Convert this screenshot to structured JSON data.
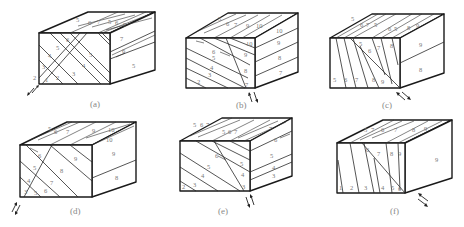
{
  "figure": {
    "panels": [
      {
        "id": "a",
        "caption": "(a)",
        "front_labels": [
          "1",
          "2",
          "3",
          "4",
          "5",
          "3",
          "4",
          "5",
          "6",
          "3",
          "2"
        ],
        "top_labels": [
          "5",
          "6",
          "7",
          "5",
          "6",
          "7"
        ],
        "right_labels": [
          "7",
          "6",
          "5"
        ],
        "shear_sense": "sinistral (arrows lower-left)"
      },
      {
        "id": "b",
        "caption": "(b)",
        "front_labels": [
          "2",
          "3",
          "4",
          "5",
          "6",
          "7",
          "8",
          "9",
          "10"
        ],
        "top_labels": [
          "5",
          "6",
          "7",
          "9",
          "10"
        ],
        "right_labels": [
          "10",
          "9",
          "8",
          "7"
        ],
        "shear_sense": "arrows below front-right corner"
      },
      {
        "id": "c",
        "caption": "(c)",
        "front_labels": [
          "5",
          "6",
          "7",
          "8",
          "9",
          "5",
          "6",
          "7",
          "8"
        ],
        "top_labels": [
          "5",
          "6",
          "7",
          "5",
          "6",
          "5",
          "8",
          "9"
        ],
        "right_labels": [
          "9",
          "8"
        ],
        "shear_sense": "arrows below front-right corner"
      },
      {
        "id": "d",
        "caption": "(d)",
        "front_labels": [
          "3",
          "4",
          "5",
          "5",
          "6",
          "6",
          "7",
          "8",
          "9"
        ],
        "top_labels": [
          "5",
          "6",
          "7",
          "9",
          "10",
          "10"
        ],
        "right_labels": [
          "9",
          "8"
        ],
        "shear_sense": "arrows lower-left"
      },
      {
        "id": "e",
        "caption": "(e)",
        "front_labels": [
          "2",
          "3",
          "4",
          "5",
          "6",
          "5",
          "4",
          "3"
        ],
        "top_labels": [
          "5",
          "6",
          "7",
          "5",
          "6",
          "7",
          "7"
        ],
        "right_labels": [
          "6",
          "5",
          "4",
          "3"
        ],
        "shear_sense": "arrows below front-right corner"
      },
      {
        "id": "f",
        "caption": "(f)",
        "front_labels": [
          "1",
          "2",
          "3",
          "4",
          "5",
          "6",
          "6",
          "7",
          "8",
          "9"
        ],
        "top_labels": [
          "5",
          "7",
          "6",
          "7",
          "8",
          "9"
        ],
        "right_labels": [
          "9"
        ],
        "shear_sense": "arrows right of front-right corner"
      }
    ]
  }
}
